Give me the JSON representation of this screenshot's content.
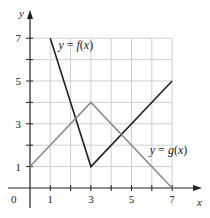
{
  "chart_data": {
    "type": "line",
    "title": "",
    "xlabel": "x",
    "ylabel": "y",
    "xlim": [
      0,
      7
    ],
    "ylim": [
      0,
      7
    ],
    "grid": true,
    "x_ticks": [
      1,
      2,
      3,
      4,
      5,
      6,
      7
    ],
    "x_tick_labels": [
      "1",
      "3",
      "5",
      "7"
    ],
    "x_tick_label_values": [
      1,
      3,
      5,
      7
    ],
    "y_ticks": [
      1,
      2,
      3,
      4,
      5,
      6,
      7
    ],
    "y_tick_labels": [
      "1",
      "3",
      "5",
      "7"
    ],
    "y_tick_label_values": [
      1,
      3,
      5,
      7
    ],
    "origin_label": "0",
    "series": [
      {
        "name": "y = f(x)",
        "color": "#222222",
        "points": [
          [
            1,
            7
          ],
          [
            3,
            1
          ],
          [
            7,
            5
          ]
        ],
        "label_position": [
          1.4,
          6.5
        ]
      },
      {
        "name": "y = g(x)",
        "color": "#8a8a8a",
        "points": [
          [
            0,
            1
          ],
          [
            3,
            4
          ],
          [
            7,
            0
          ]
        ],
        "label_position": [
          5.9,
          1.6
        ]
      }
    ]
  }
}
